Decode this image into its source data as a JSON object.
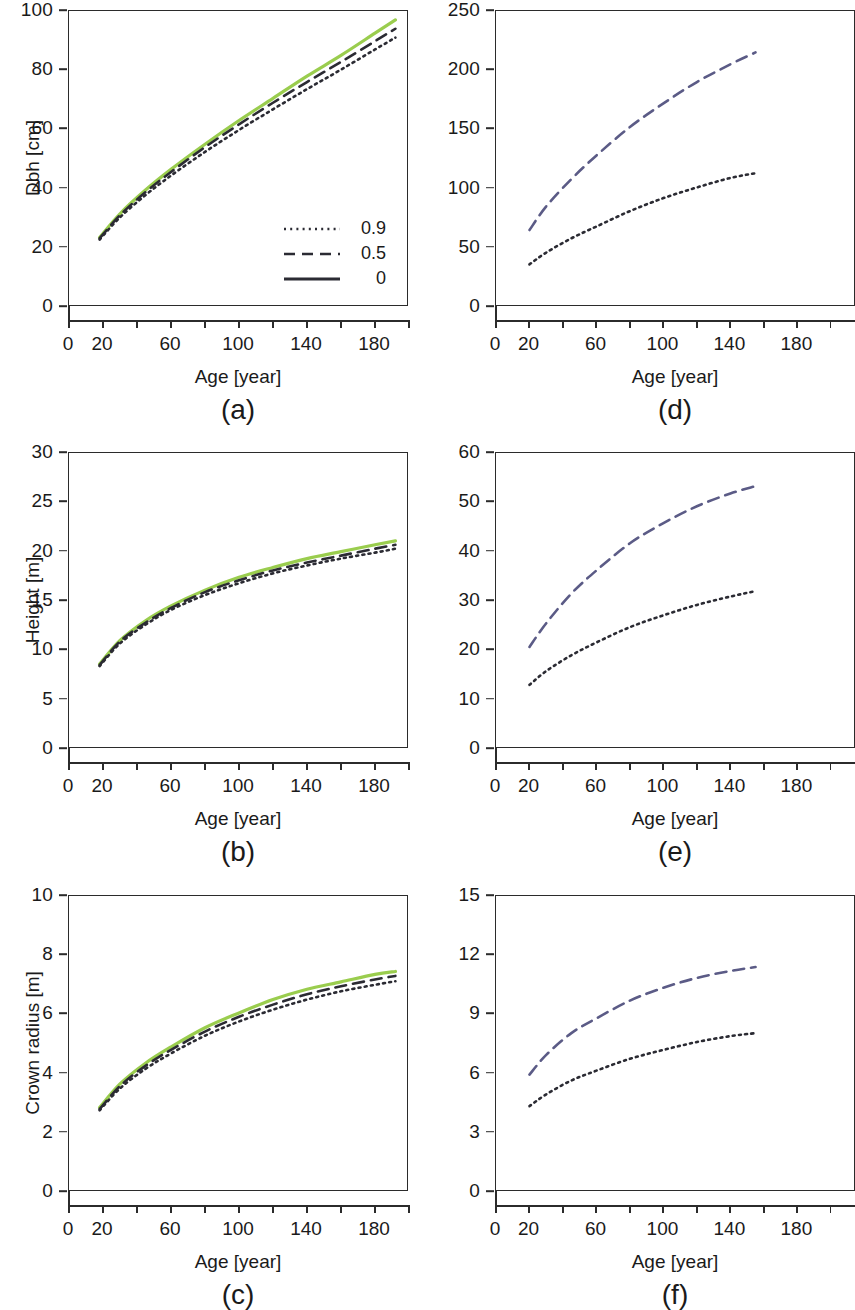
{
  "figure": {
    "axis_color": "#2b2b2b",
    "x_axis_title": "Age [year]",
    "x_ticks_labeled": [
      0,
      20,
      60,
      100,
      140,
      180
    ],
    "x_ticks_all": [
      0,
      20,
      40,
      60,
      80,
      100,
      120,
      140,
      160,
      180,
      200
    ],
    "x_range": [
      0,
      200
    ]
  },
  "legend": {
    "title": "",
    "items": [
      {
        "label": "0.9",
        "style": "dotted",
        "key": "dotted-line-key"
      },
      {
        "label": "0.5",
        "style": "dashed",
        "key": "dashed-line-key"
      },
      {
        "label": "0",
        "style": "solid",
        "key": "solid-line-key"
      }
    ]
  },
  "colors": {
    "green": "#9ACD4E",
    "dark": "#2b2b33",
    "slate_blue": "#5b5b86"
  },
  "chart_data": [
    {
      "id": "panel-a",
      "type": "line",
      "letter": "(a)",
      "title": "",
      "xlabel": "Age [year]",
      "ylabel": "Dbh [cm]",
      "xlim": [
        0,
        200
      ],
      "ylim": [
        0,
        100
      ],
      "yticks": [
        0,
        20,
        40,
        60,
        80,
        100
      ],
      "grid": false,
      "legend_position": "bottom-right",
      "x": [
        18,
        30,
        45,
        60,
        80,
        100,
        120,
        140,
        160,
        180,
        192
      ],
      "series": [
        {
          "name": "0",
          "style": "solid",
          "color": "#9ACD4E",
          "values": [
            23.5,
            31.5,
            39.5,
            46.5,
            55.0,
            63.0,
            70.5,
            78.0,
            85.0,
            92.5,
            97.0
          ]
        },
        {
          "name": "0.5",
          "style": "dashed",
          "color": "#2b2b33",
          "values": [
            23.2,
            31.0,
            38.8,
            45.6,
            54.0,
            61.7,
            69.0,
            76.0,
            82.8,
            89.8,
            94.0
          ]
        },
        {
          "name": "0.9",
          "style": "dotted",
          "color": "#2b2b33",
          "values": [
            22.8,
            30.3,
            37.8,
            44.4,
            52.4,
            59.8,
            66.8,
            73.6,
            80.2,
            87.0,
            91.0
          ]
        }
      ]
    },
    {
      "id": "panel-b",
      "type": "line",
      "letter": "(b)",
      "title": "",
      "xlabel": "Age [year]",
      "ylabel": "Height [m]",
      "xlim": [
        0,
        200
      ],
      "ylim": [
        0,
        30
      ],
      "yticks": [
        0,
        5,
        10,
        15,
        20,
        25,
        30
      ],
      "grid": false,
      "legend_position": "none",
      "x": [
        18,
        30,
        45,
        60,
        80,
        100,
        120,
        140,
        160,
        180,
        192
      ],
      "series": [
        {
          "name": "0",
          "style": "solid",
          "color": "#9ACD4E",
          "values": [
            8.6,
            11.0,
            13.0,
            14.5,
            16.1,
            17.4,
            18.4,
            19.3,
            20.0,
            20.7,
            21.1
          ]
        },
        {
          "name": "0.5",
          "style": "dashed",
          "color": "#2b2b33",
          "values": [
            8.5,
            10.9,
            12.8,
            14.3,
            15.9,
            17.1,
            18.1,
            18.9,
            19.6,
            20.3,
            20.7
          ]
        },
        {
          "name": "0.9",
          "style": "dotted",
          "color": "#2b2b33",
          "values": [
            8.4,
            10.7,
            12.6,
            14.1,
            15.6,
            16.8,
            17.8,
            18.6,
            19.3,
            19.9,
            20.3
          ]
        }
      ]
    },
    {
      "id": "panel-c",
      "type": "line",
      "letter": "(c)",
      "title": "",
      "xlabel": "Age [year]",
      "ylabel": "Crown radius [m]",
      "xlim": [
        0,
        200
      ],
      "ylim": [
        0,
        10
      ],
      "yticks": [
        0,
        2,
        4,
        6,
        8,
        10
      ],
      "grid": false,
      "legend_position": "none",
      "x": [
        18,
        30,
        45,
        60,
        80,
        100,
        120,
        140,
        160,
        180,
        192
      ],
      "series": [
        {
          "name": "0",
          "style": "solid",
          "color": "#9ACD4E",
          "values": [
            2.85,
            3.65,
            4.35,
            4.9,
            5.55,
            6.05,
            6.5,
            6.85,
            7.1,
            7.35,
            7.45
          ]
        },
        {
          "name": "0.5",
          "style": "dashed",
          "color": "#2b2b33",
          "values": [
            2.8,
            3.58,
            4.26,
            4.8,
            5.42,
            5.92,
            6.33,
            6.68,
            6.95,
            7.18,
            7.3
          ]
        },
        {
          "name": "0.9",
          "style": "dotted",
          "color": "#2b2b33",
          "values": [
            2.76,
            3.5,
            4.16,
            4.68,
            5.28,
            5.76,
            6.16,
            6.5,
            6.78,
            7.0,
            7.12
          ]
        }
      ]
    },
    {
      "id": "panel-d",
      "type": "line",
      "letter": "(d)",
      "title": "",
      "xlabel": "Age [year]",
      "ylabel": "",
      "xlim": [
        0,
        215
      ],
      "ylim": [
        0,
        250
      ],
      "yticks": [
        0,
        50,
        100,
        150,
        200,
        250
      ],
      "grid": false,
      "legend_position": "none",
      "x": [
        20,
        30,
        45,
        60,
        80,
        100,
        120,
        140,
        155
      ],
      "series": [
        {
          "name": "0.5",
          "style": "dashed",
          "color": "#5b5b86",
          "values": [
            65,
            85,
            108,
            128,
            152,
            172,
            190,
            205,
            215
          ]
        },
        {
          "name": "0.9",
          "style": "dotted",
          "color": "#2b2b33",
          "values": [
            36,
            46,
            58,
            68,
            81,
            92,
            101,
            109,
            113
          ]
        }
      ]
    },
    {
      "id": "panel-e",
      "type": "line",
      "letter": "(e)",
      "title": "",
      "xlabel": "Age [year]",
      "ylabel": "",
      "xlim": [
        0,
        215
      ],
      "ylim": [
        0,
        60
      ],
      "yticks": [
        0,
        10,
        20,
        30,
        40,
        50,
        60
      ],
      "grid": false,
      "legend_position": "none",
      "x": [
        20,
        30,
        45,
        60,
        80,
        100,
        120,
        140,
        155
      ],
      "series": [
        {
          "name": "0.5",
          "style": "dashed",
          "color": "#5b5b86",
          "values": [
            20.7,
            25.5,
            31.5,
            36.2,
            41.7,
            45.8,
            49.2,
            51.8,
            53.3
          ]
        },
        {
          "name": "0.9",
          "style": "dotted",
          "color": "#2b2b33",
          "values": [
            13.0,
            15.8,
            19.0,
            21.6,
            24.7,
            27.1,
            29.2,
            30.9,
            32.0
          ]
        }
      ]
    },
    {
      "id": "panel-f",
      "type": "line",
      "letter": "(f)",
      "title": "",
      "xlabel": "Age [year]",
      "ylabel": "",
      "xlim": [
        0,
        215
      ],
      "ylim": [
        0,
        15
      ],
      "yticks": [
        0,
        3,
        6,
        9,
        12,
        15
      ],
      "grid": false,
      "legend_position": "none",
      "x": [
        20,
        30,
        45,
        60,
        80,
        100,
        120,
        140,
        155
      ],
      "series": [
        {
          "name": "0.5",
          "style": "dashed",
          "color": "#5b5b86",
          "values": [
            5.95,
            6.95,
            8.05,
            8.8,
            9.7,
            10.35,
            10.85,
            11.2,
            11.4
          ]
        },
        {
          "name": "0.9",
          "style": "dotted",
          "color": "#2b2b33",
          "values": [
            4.35,
            4.95,
            5.65,
            6.15,
            6.75,
            7.2,
            7.6,
            7.9,
            8.05
          ]
        }
      ]
    }
  ]
}
